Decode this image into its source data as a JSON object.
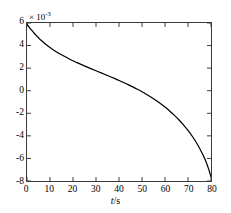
{
  "figure": {
    "background": "#ffffff",
    "axis_color": "#3a3a3a",
    "curve_color": "#000000"
  },
  "axes": {
    "y_exponent_prefix": "× 10",
    "y_exponent_power": "-3",
    "x_title_var": "t",
    "x_title_unit": "/s",
    "x_title_full": "t/s",
    "y_ticks": [
      "6",
      "4",
      "2",
      "0",
      "-2",
      "-4",
      "-6",
      "-8"
    ],
    "x_ticks": [
      "0",
      "10",
      "20",
      "30",
      "40",
      "50",
      "60",
      "70",
      "80"
    ]
  },
  "chart_data": {
    "type": "line",
    "title": "",
    "subtitle": "",
    "xlabel": "t/s",
    "ylabel": "",
    "y_axis_exponent": -3,
    "y_axis_exponent_label": "× 10^-3",
    "xlim": [
      0,
      80
    ],
    "ylim": [
      -8,
      6
    ],
    "xticks": [
      0,
      10,
      20,
      30,
      40,
      50,
      60,
      70,
      80
    ],
    "yticks": [
      6,
      4,
      2,
      0,
      -2,
      -4,
      -6,
      -8
    ],
    "grid": false,
    "legend": null,
    "tick_direction": "in",
    "box": true,
    "series": [
      {
        "name": "signal",
        "color": "#000000",
        "linewidth": 1,
        "x": [
          0,
          1,
          2,
          3,
          4,
          5,
          6,
          8,
          10,
          12,
          14,
          16,
          18,
          20,
          22,
          24,
          26,
          28,
          30,
          32,
          34,
          36,
          38,
          40,
          42,
          44,
          46,
          48,
          50,
          52,
          54,
          56,
          58,
          60,
          62,
          64,
          66,
          68,
          70,
          72,
          74,
          76,
          77,
          78,
          79,
          79.5,
          80
        ],
        "y": [
          5.9,
          5.62,
          5.36,
          5.12,
          4.9,
          4.69,
          4.49,
          4.14,
          3.83,
          3.55,
          3.3,
          3.07,
          2.86,
          2.66,
          2.47,
          2.29,
          2.11,
          1.94,
          1.77,
          1.6,
          1.43,
          1.26,
          1.09,
          0.91,
          0.73,
          0.54,
          0.34,
          0.13,
          -0.09,
          -0.33,
          -0.58,
          -0.85,
          -1.14,
          -1.45,
          -1.79,
          -2.16,
          -2.57,
          -3.02,
          -3.52,
          -4.08,
          -4.72,
          -5.47,
          -5.9,
          -6.38,
          -6.95,
          -7.28,
          -7.62
        ],
        "y_units": "1e-3"
      }
    ]
  }
}
